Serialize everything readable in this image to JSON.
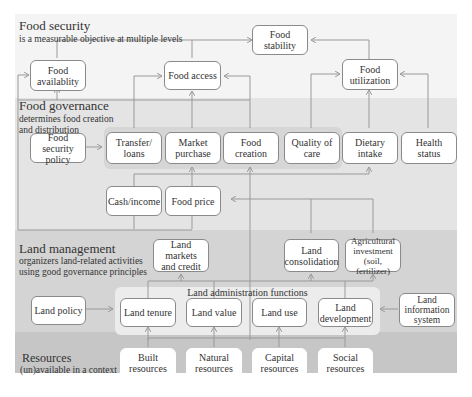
{
  "layers": {
    "food_security": {
      "title": "Food security",
      "subtitle": "is a measurable objective at multiple levels"
    },
    "food_governance": {
      "title": "Food governance",
      "subtitle": "determines food creation\nand distribution"
    },
    "land_management": {
      "title": "Land management",
      "subtitle": "organizers land-related activities\nusing good governance principles"
    },
    "resources": {
      "title": "Resources",
      "subtitle": "(un)available in a context"
    }
  },
  "land_admin_label": "Land administration functions",
  "boxes": {
    "food_stability": "Food\nstability",
    "food_availability": "Food\navailablity",
    "food_access": "Food access",
    "food_utilization": "Food\nutilization",
    "food_security_policy": "Food security\npolicy",
    "transfer_loans": "Transfer/\nloans",
    "market_purchase": "Market\npurchase",
    "food_creation": "Food\ncreation",
    "quality_of_care": "Quality of\ncare",
    "dietary_intake": "Dietary\nintake",
    "health_status": "Health\nstatus",
    "cash_income": "Cash/income",
    "food_price": "Food price",
    "land_markets_credit": "Land markets\nand credit",
    "land_consolidation": "Land\nconsolidation",
    "agricultural_investment": "Agricultural\ninvestment\n(soil, fertilizer)",
    "land_policy": "Land policy",
    "land_tenure": "Land tenure",
    "land_value": "Land value",
    "land_use": "Land use",
    "land_development": "Land\ndevelopment",
    "land_information_system": "Land\ninformation\nsystem",
    "built_resources": "Built\nresources",
    "natural_resources": "Natural\nresources",
    "capital_resources": "Capital\nresources",
    "social_resources": "Social\nresources"
  }
}
